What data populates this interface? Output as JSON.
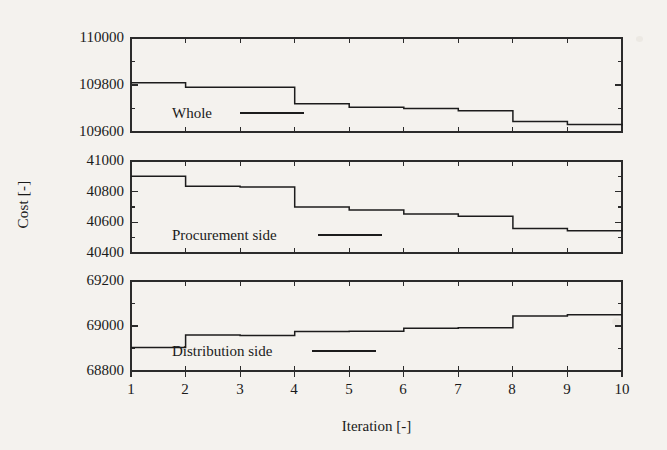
{
  "chart_data": {
    "type": "line",
    "title": "",
    "xlabel": "Iteration [-]",
    "ylabel": "Cost [-]",
    "grid": false,
    "step_style": "post",
    "x": [
      1,
      2,
      3,
      4,
      5,
      6,
      7,
      8,
      9,
      10
    ],
    "xlim": [
      1,
      10
    ],
    "xticks": [
      "1",
      "2",
      "3",
      "4",
      "5",
      "6",
      "7",
      "8",
      "9",
      "10"
    ],
    "panels": [
      {
        "name": "Whole",
        "legend": "Whole",
        "ylim": [
          109600,
          110000
        ],
        "yticks": [
          "110000",
          "109800",
          "109600"
        ],
        "ytick_values": [
          110000,
          109800,
          109600
        ],
        "minor_ticks": [
          109900,
          109700
        ],
        "values": [
          109810,
          109790,
          109790,
          109720,
          109705,
          109700,
          109690,
          109645,
          109632,
          109628
        ]
      },
      {
        "name": "Procurement side",
        "legend": "Procurement side",
        "ylim": [
          40400,
          41000
        ],
        "yticks": [
          "41000",
          "40800",
          "40600",
          "40400"
        ],
        "ytick_values": [
          41000,
          40800,
          40600,
          40400
        ],
        "minor_ticks": [
          40900,
          40700,
          40500
        ],
        "values": [
          40900,
          40835,
          40830,
          40700,
          40680,
          40655,
          40640,
          40560,
          40545,
          40540
        ]
      },
      {
        "name": "Distribution side",
        "legend": "Distribution side",
        "ylim": [
          68800,
          69200
        ],
        "yticks": [
          "69200",
          "69000",
          "68800"
        ],
        "ytick_values": [
          69200,
          69000,
          68800
        ],
        "minor_ticks": [
          69100,
          68900
        ],
        "values": [
          68905,
          68960,
          68958,
          68975,
          68977,
          68990,
          68992,
          69045,
          69050,
          69050
        ]
      }
    ]
  },
  "axis": {
    "xlabel": "Iteration [-]",
    "ylabel": "Cost [-]"
  }
}
